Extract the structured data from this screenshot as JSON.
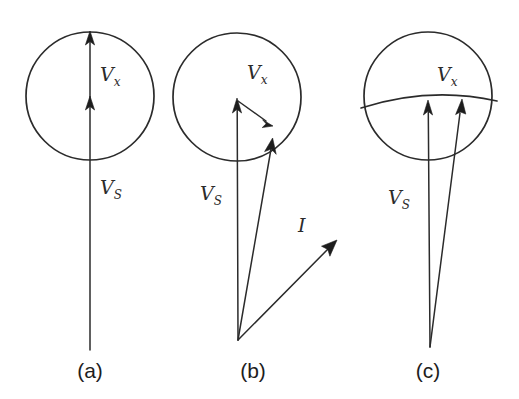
{
  "figure": {
    "background_color": "#ffffff",
    "stroke_color": "#2b2b2b",
    "width": 519,
    "height": 399,
    "type": "vector-diagram"
  },
  "panels": [
    {
      "id": "a",
      "caption": "(a)",
      "caption_x": 90,
      "caption_y": 378,
      "circle": {
        "cx": 90,
        "cy": 96,
        "r": 64
      },
      "labels": [
        {
          "name": "vx",
          "base": "V",
          "sub": "x",
          "x": 100,
          "y": 80
        },
        {
          "name": "vs",
          "base": "V",
          "sub": "S",
          "x": 100,
          "y": 193
        }
      ],
      "vectors": [
        {
          "name": "vs-vector",
          "x1": 90,
          "y1": 350,
          "x2": 90,
          "y2": 33
        },
        {
          "name": "vx-arrowhead",
          "x": 90,
          "y": 101,
          "angle": -90
        }
      ]
    },
    {
      "id": "b",
      "caption": "(b)",
      "caption_x": 253,
      "caption_y": 378,
      "circle": {
        "cx": 237,
        "cy": 97,
        "r": 64
      },
      "labels": [
        {
          "name": "vx",
          "base": "V",
          "sub": "x",
          "x": 247,
          "y": 78
        },
        {
          "name": "vs",
          "base": "V",
          "sub": "S",
          "x": 200,
          "y": 199
        },
        {
          "name": "i",
          "base": "I",
          "sub": "",
          "x": 298,
          "y": 232
        }
      ],
      "vectors": [
        {
          "name": "vs-vector",
          "x1": 238,
          "y1": 340,
          "x2": 237,
          "y2": 100
        },
        {
          "name": "resultant-vector",
          "x1": 238,
          "y1": 340,
          "x2": 272,
          "y2": 140
        },
        {
          "name": "vx-connector",
          "x1": 237,
          "y1": 101,
          "x2": 272,
          "y2": 126
        },
        {
          "name": "i-vector",
          "x1": 238,
          "y1": 340,
          "x2": 336,
          "y2": 241
        }
      ]
    },
    {
      "id": "c",
      "caption": "(c)",
      "caption_x": 428,
      "caption_y": 378,
      "circle": {
        "cx": 428,
        "cy": 96,
        "r": 64
      },
      "arc": {
        "x1": 361,
        "y1": 108,
        "x2": 497,
        "y2": 101,
        "sweep_top": 94
      },
      "labels": [
        {
          "name": "vx",
          "base": "V",
          "sub": "x",
          "x": 437,
          "y": 80
        },
        {
          "name": "vs",
          "base": "V",
          "sub": "S",
          "x": 388,
          "y": 203
        }
      ],
      "vectors": [
        {
          "name": "vs-vector",
          "x1": 430,
          "y1": 347,
          "x2": 428,
          "y2": 103
        },
        {
          "name": "resultant-vector",
          "x1": 430,
          "y1": 347,
          "x2": 462,
          "y2": 101
        }
      ]
    }
  ],
  "symbols": {
    "velocity_spacecraft": "V_S",
    "velocity_exhaust": "V_x",
    "current": "I"
  }
}
